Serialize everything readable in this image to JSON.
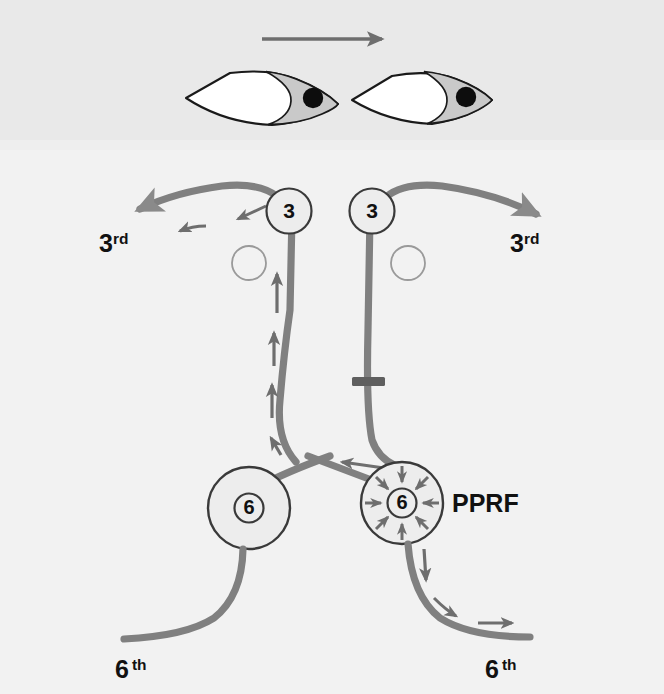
{
  "figure": {
    "background_color": "#f2f2f2",
    "band_color": "#e8e8e8",
    "tract_color": "#808080",
    "arrow_color": "#6e6e6e",
    "outline_color": "#1a1a1a",
    "iris_color": "#c9c9c9",
    "pupil_color": "#0d0d0d",
    "nucleus_fill": "#ededed"
  },
  "gaze": {
    "direction_arrow_name": "gaze-direction-arrow",
    "direction": "right"
  },
  "eyes": [
    {
      "id": "left-eye",
      "side": "left",
      "gaze": "right"
    },
    {
      "id": "right-eye",
      "side": "right",
      "gaze": "right"
    }
  ],
  "nuclei": {
    "oculomotor_left": {
      "label": "3",
      "name": "oculomotor-nucleus-left"
    },
    "oculomotor_right": {
      "label": "3",
      "name": "oculomotor-nucleus-right"
    },
    "abducens_left": {
      "label": "6",
      "name": "abducens-nucleus-left"
    },
    "abducens_right": {
      "label": "6",
      "name": "abducens-nucleus-right",
      "burst": true
    }
  },
  "labels": {
    "third_left": {
      "number": "3",
      "ordinal": "rd"
    },
    "third_right": {
      "number": "3",
      "ordinal": "rd"
    },
    "sixth_left": {
      "number": "6",
      "ordinal": "th"
    },
    "sixth_right": {
      "number": "6",
      "ordinal": "th"
    },
    "pprf": "PPRF"
  },
  "markers": {
    "inhibitory_synapse": {
      "name": "inhibitory-synapse-marker",
      "shape": "t-bar"
    },
    "small_circles": [
      {
        "name": "open-circle-left"
      },
      {
        "name": "open-circle-right"
      }
    ]
  },
  "flow_arrows": {
    "ascending_mlf_count": 4,
    "third_nerve_left_count": 2,
    "sixth_nerve_right_count": 3,
    "pprf_burst_count": 8,
    "decussation_count": 1
  }
}
